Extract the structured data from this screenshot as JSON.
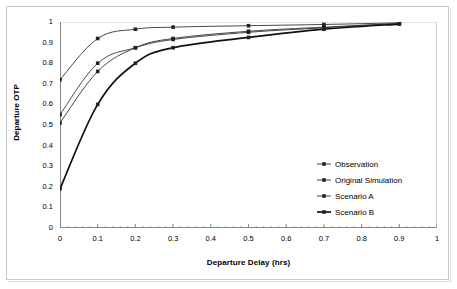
{
  "chart_data": {
    "type": "line",
    "title": "",
    "xlabel": "Departure Delay (hrs)",
    "ylabel": "Departure OTP",
    "xlim": [
      0,
      1
    ],
    "ylim": [
      0,
      1
    ],
    "xticks": [
      "0",
      "0.1",
      "0.2",
      "0.3",
      "0.4",
      "0.5",
      "0.6",
      "0.7",
      "0.8",
      "0.9",
      "1"
    ],
    "yticks": [
      "0",
      "0.1",
      "0.2",
      "0.3",
      "0.4",
      "0.5",
      "0.6",
      "0.7",
      "0.8",
      "0.9",
      "1"
    ],
    "xtick_values": [
      0,
      0.1,
      0.2,
      0.3,
      0.4,
      0.5,
      0.6,
      0.7,
      0.8,
      0.9,
      1
    ],
    "ytick_values": [
      0,
      0.1,
      0.2,
      0.3,
      0.4,
      0.5,
      0.6,
      0.7,
      0.8,
      0.9,
      1
    ],
    "grid": "horizontal-top-only",
    "minor_xticks": true,
    "legend_position": "inside-lower-right",
    "x": [
      0,
      0.1,
      0.2,
      0.3,
      0.5,
      0.7,
      0.9
    ],
    "series": [
      {
        "name": "Observation",
        "marker": "square",
        "color": "#333333",
        "line_width": 0.9,
        "values": [
          0.72,
          0.92,
          0.965,
          0.975,
          0.982,
          0.988,
          0.996
        ]
      },
      {
        "name": "Original Simulation",
        "marker": "square",
        "color": "#333333",
        "line_width": 0.9,
        "values": [
          0.55,
          0.8,
          0.875,
          0.915,
          0.95,
          0.972,
          0.993
        ]
      },
      {
        "name": "Scenario A",
        "marker": "square",
        "color": "#333333",
        "line_width": 0.9,
        "values": [
          0.51,
          0.76,
          0.875,
          0.92,
          0.955,
          0.975,
          0.993
        ]
      },
      {
        "name": "Scenario B",
        "marker": "square",
        "color": "#111111",
        "line_width": 1.7,
        "values": [
          0.19,
          0.6,
          0.8,
          0.875,
          0.925,
          0.965,
          0.99
        ]
      }
    ]
  },
  "legend": {
    "items": [
      {
        "label": "Observation"
      },
      {
        "label": "Original Simulation"
      },
      {
        "label": "Scenario A"
      },
      {
        "label": "Scenario B"
      }
    ]
  },
  "axes": {
    "x_title": "Departure Delay (hrs)",
    "y_title": "Departure OTP"
  },
  "colors": {
    "frame": "#c9c9c9",
    "axis": "#888888",
    "gridline": "#cccccc",
    "marker": "#222222",
    "emphasis_line": "#111111"
  }
}
